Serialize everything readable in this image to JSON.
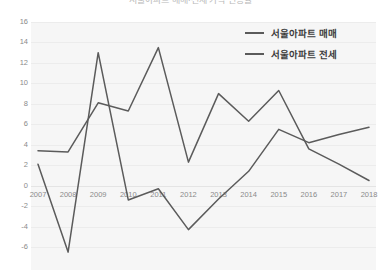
{
  "chart_data": {
    "type": "line",
    "title": "서울아파트 매매·전세 가격 변동률",
    "xlabel": "",
    "ylabel": "",
    "ylim": [
      -6,
      16
    ],
    "yticks": [
      16,
      14,
      12,
      10,
      8,
      6,
      4,
      2,
      0,
      -2,
      -4,
      -6
    ],
    "grid": true,
    "legend_position": "top-right",
    "categories": [
      "2007",
      "2008",
      "2009",
      "2010",
      "2011",
      "2012",
      "2013",
      "2014",
      "2015",
      "2016",
      "2017",
      "2018"
    ],
    "series": [
      {
        "name": "서울아파트 매매",
        "color": "#5b5b5b",
        "values": [
          2.1,
          -6.5,
          13.0,
          -1.4,
          -0.3,
          -4.3,
          -1.3,
          1.4,
          5.5,
          4.2,
          5.0,
          5.7
        ]
      },
      {
        "name": "서울아파트 전세",
        "color": "#5b5b5b",
        "values": [
          3.4,
          3.3,
          8.1,
          7.3,
          13.5,
          2.3,
          9.0,
          6.3,
          9.3,
          3.6,
          2.1,
          0.5
        ]
      }
    ]
  },
  "legend": {
    "items": [
      {
        "label": "서울아파트 매매"
      },
      {
        "label": "서울아파트 전세"
      }
    ]
  },
  "axis": {
    "y_labels": [
      "16",
      "14",
      "12",
      "10",
      "8",
      "6",
      "4",
      "2",
      "0",
      "-2",
      "-4",
      "-6"
    ],
    "x_labels": [
      "2007",
      "2008",
      "2009",
      "2010",
      "2011",
      "2012",
      "2013",
      "2014",
      "2015",
      "2016",
      "2017",
      "2018"
    ]
  }
}
